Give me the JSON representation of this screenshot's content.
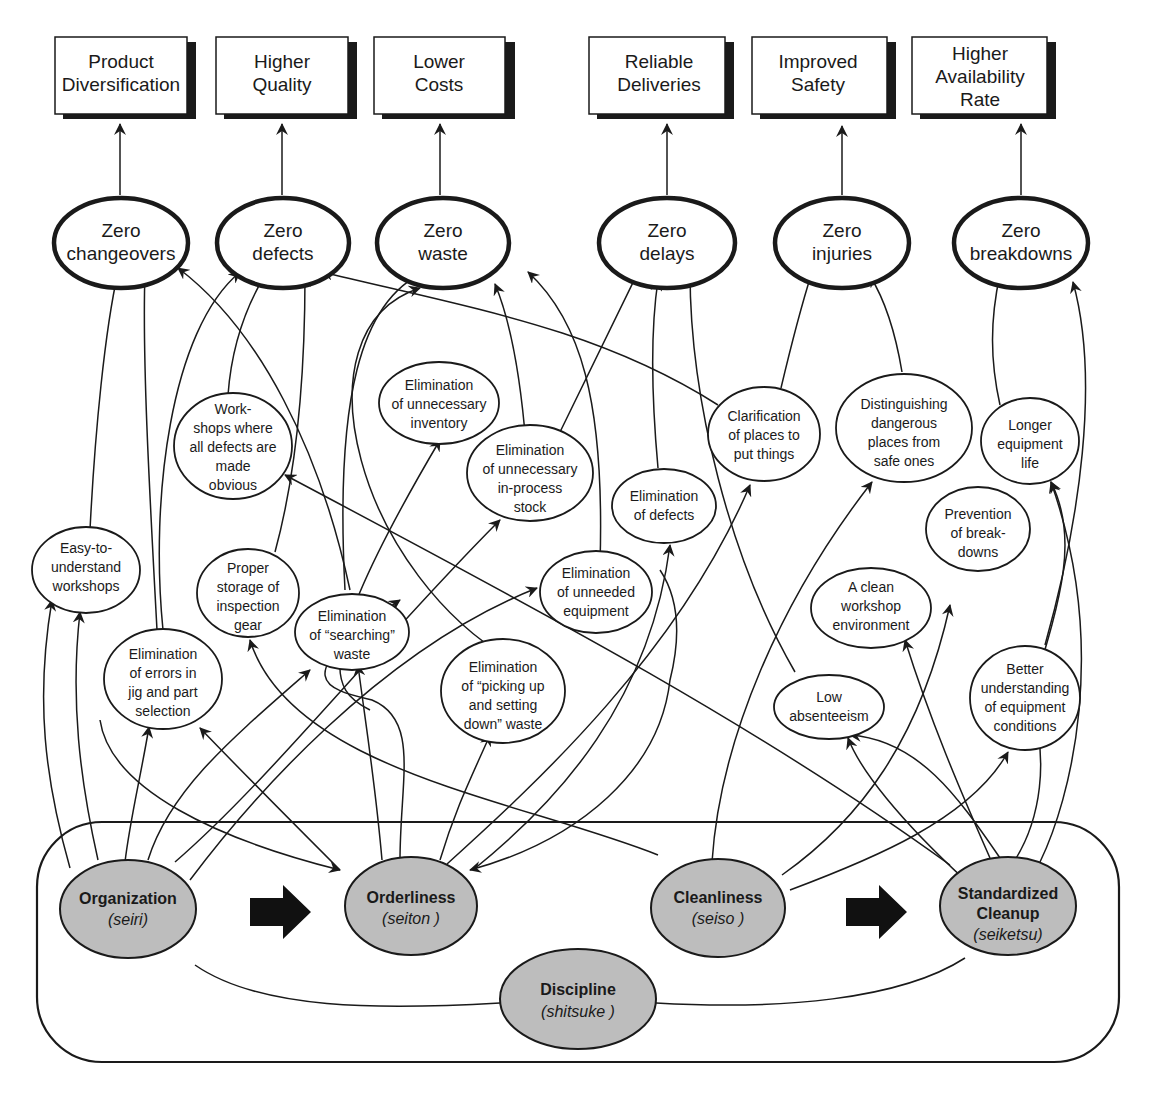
{
  "outcomes": [
    {
      "lines": [
        "Product",
        "Diversification"
      ]
    },
    {
      "lines": [
        "Higher",
        "Quality"
      ]
    },
    {
      "lines": [
        "Lower",
        "Costs"
      ]
    },
    {
      "lines": [
        "Reliable",
        "Deliveries"
      ]
    },
    {
      "lines": [
        "Improved",
        "Safety"
      ]
    },
    {
      "lines": [
        "Higher",
        "Availability",
        "Rate"
      ]
    }
  ],
  "zero_goals": [
    {
      "lines": [
        "Zero",
        "changeovers"
      ]
    },
    {
      "lines": [
        "Zero",
        "defects"
      ]
    },
    {
      "lines": [
        "Zero",
        "waste"
      ]
    },
    {
      "lines": [
        "Zero",
        "delays"
      ]
    },
    {
      "lines": [
        "Zero",
        "injuries"
      ]
    },
    {
      "lines": [
        "Zero",
        "breakdowns"
      ]
    }
  ],
  "benefits": [
    {
      "id": "workshops-defects-obvious",
      "lines": [
        "Work-",
        "shops where",
        "all defects are",
        "made",
        "obvious"
      ]
    },
    {
      "id": "elim-unnecessary-inventory",
      "lines": [
        "Elimination",
        "of unnecessary",
        "inventory"
      ]
    },
    {
      "id": "elim-in-process-stock",
      "lines": [
        "Elimination",
        "of unnecessary",
        "in-process",
        "stock"
      ]
    },
    {
      "id": "clarification-places",
      "lines": [
        "Clarification",
        "of places to",
        "put things"
      ]
    },
    {
      "id": "distinguishing-dangerous",
      "lines": [
        "Distinguishing",
        "dangerous",
        "places from",
        "safe ones"
      ]
    },
    {
      "id": "longer-equipment-life",
      "lines": [
        "Longer",
        "equipment",
        "life"
      ]
    },
    {
      "id": "elim-defects",
      "lines": [
        "Elimination",
        "of defects"
      ]
    },
    {
      "id": "prevention-breakdowns",
      "lines": [
        "Prevention",
        "of break-",
        "downs"
      ]
    },
    {
      "id": "easy-to-understand",
      "lines": [
        "Easy-to-",
        "understand",
        "workshops"
      ]
    },
    {
      "id": "proper-storage",
      "lines": [
        "Proper",
        "storage of",
        "inspection",
        "gear"
      ]
    },
    {
      "id": "elim-unneeded-equipment",
      "lines": [
        "Elimination",
        "of unneeded",
        "equipment"
      ]
    },
    {
      "id": "clean-workshop",
      "lines": [
        "A clean",
        "workshop",
        "environment"
      ]
    },
    {
      "id": "elim-searching",
      "lines": [
        "Elimination",
        "of “searching”",
        "waste"
      ]
    },
    {
      "id": "elim-errors-jig",
      "lines": [
        "Elimination",
        "of errors in",
        "jig and part",
        "selection"
      ]
    },
    {
      "id": "elim-picking-up",
      "lines": [
        "Elimination",
        "of “picking up",
        "and setting",
        "down” waste"
      ]
    },
    {
      "id": "low-absenteeism",
      "lines": [
        "Low",
        "absenteeism"
      ]
    },
    {
      "id": "better-understanding",
      "lines": [
        "Better",
        "understanding",
        "of equipment",
        "conditions"
      ]
    }
  ],
  "five_s": [
    {
      "name": "Organization",
      "japanese": "(seiri)"
    },
    {
      "name": "Orderliness",
      "japanese": "(seiton )"
    },
    {
      "name": "Cleanliness",
      "japanese": "(seiso )"
    },
    {
      "name_lines": [
        "Standardized",
        "Cleanup"
      ],
      "japanese": "(seiketsu)"
    },
    {
      "name": "Discipline",
      "japanese": "(shitsuke )"
    }
  ],
  "colors": {
    "line": "#1a1a1a",
    "s_fill": "#bdbdbd",
    "background": "#ffffff"
  }
}
